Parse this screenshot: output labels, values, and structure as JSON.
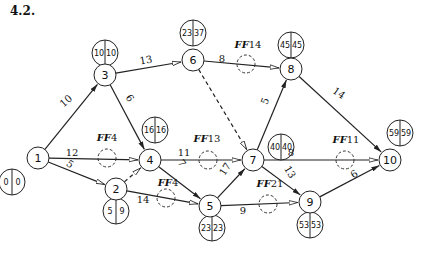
{
  "title": "4.2.",
  "nodes": [
    {
      "id": "1",
      "x": 38,
      "y": 158,
      "es": "0",
      "ls": "0",
      "tx": 12,
      "ty": 182
    },
    {
      "id": "2",
      "x": 116,
      "y": 189,
      "es": "5",
      "ls": "9",
      "tx": 116,
      "ty": 211
    },
    {
      "id": "3",
      "x": 105,
      "y": 75,
      "es": "10",
      "ls": "10",
      "tx": 105,
      "ty": 53
    },
    {
      "id": "4",
      "x": 150,
      "y": 160,
      "es": "16",
      "ls": "16",
      "tx": 155,
      "ty": 130
    },
    {
      "id": "5",
      "x": 210,
      "y": 206,
      "es": "23",
      "ls": "23",
      "tx": 212,
      "ty": 228
    },
    {
      "id": "6",
      "x": 193,
      "y": 60,
      "es": "23",
      "ls": "37",
      "tx": 193,
      "ty": 33
    },
    {
      "id": "7",
      "x": 253,
      "y": 160,
      "es": "40",
      "ls": "40",
      "tx": 281,
      "ty": 147
    },
    {
      "id": "8",
      "x": 291,
      "y": 69,
      "es": "45",
      "ls": "45",
      "tx": 291,
      "ty": 45
    },
    {
      "id": "9",
      "x": 310,
      "y": 202,
      "es": "53",
      "ls": "53",
      "tx": 310,
      "ty": 225
    },
    {
      "id": "10",
      "x": 390,
      "y": 160,
      "es": "59",
      "ls": "59",
      "tx": 400,
      "ty": 133
    }
  ],
  "edges": [
    {
      "from": "1",
      "to": "3",
      "duration": "10",
      "critical": true,
      "dashed": false,
      "lx": 66,
      "ly": 101,
      "rot": -42
    },
    {
      "from": "1",
      "to": "4",
      "duration": "12",
      "critical": false,
      "dashed": false,
      "lx": 72,
      "ly": 152,
      "rot": 0,
      "ff": {
        "label": "FF",
        "value": "4",
        "cx": 107,
        "cy": 158,
        "tx": 107,
        "ty": 141
      }
    },
    {
      "from": "1",
      "to": "2",
      "duration": "5",
      "critical": false,
      "dashed": false,
      "lx": 70,
      "ly": 164,
      "rot": 35
    },
    {
      "from": "3",
      "to": "6",
      "duration": "13",
      "critical": false,
      "dashed": false,
      "lx": 146,
      "ly": 60,
      "rot": -10
    },
    {
      "from": "3",
      "to": "4",
      "duration": "6",
      "critical": true,
      "dashed": false,
      "lx": 130,
      "ly": 98,
      "rot": 55
    },
    {
      "from": "2",
      "to": "4",
      "duration": "",
      "critical": false,
      "dashed": true
    },
    {
      "from": "4",
      "to": "7",
      "duration": "11",
      "critical": false,
      "dashed": false,
      "lx": 184,
      "ly": 152,
      "rot": 0,
      "ff": {
        "label": "FF",
        "value": "13",
        "cx": 208,
        "cy": 160,
        "tx": 207,
        "ty": 142
      }
    },
    {
      "from": "4",
      "to": "5",
      "duration": "7",
      "critical": true,
      "dashed": false,
      "lx": 182,
      "ly": 163,
      "rot": 55
    },
    {
      "from": "2",
      "to": "5",
      "duration": "14",
      "critical": false,
      "dashed": false,
      "lx": 143,
      "ly": 199,
      "rot": 0,
      "ff": {
        "label": "FF",
        "value": "4",
        "cx": 166,
        "cy": 198,
        "tx": 168,
        "ty": 186
      }
    },
    {
      "from": "5",
      "to": "7",
      "duration": "17",
      "critical": true,
      "dashed": false,
      "lx": 225,
      "ly": 169,
      "rot": -57
    },
    {
      "from": "6",
      "to": "8",
      "duration": "8",
      "critical": false,
      "dashed": false,
      "lx": 222,
      "ly": 58,
      "rot": 0,
      "ff": {
        "label": "FF",
        "value": "14",
        "cx": 246,
        "cy": 64,
        "tx": 248,
        "ty": 48
      }
    },
    {
      "from": "6",
      "to": "7",
      "duration": "",
      "critical": false,
      "dashed": true
    },
    {
      "from": "7",
      "to": "8",
      "duration": "5",
      "critical": true,
      "dashed": false,
      "lx": 265,
      "ly": 101,
      "rot": -68
    },
    {
      "from": "5",
      "to": "9",
      "duration": "9",
      "critical": false,
      "dashed": false,
      "lx": 243,
      "ly": 210,
      "rot": 0,
      "ff": {
        "label": "FF",
        "value": "21",
        "cx": 268,
        "cy": 204,
        "tx": 270,
        "ty": 187
      }
    },
    {
      "from": "7",
      "to": "10",
      "duration": "8",
      "critical": false,
      "dashed": false,
      "lx": 291,
      "ly": 152,
      "rot": 0,
      "ff": {
        "label": "FF",
        "value": "11",
        "cx": 345,
        "cy": 160,
        "tx": 346,
        "ty": 143
      }
    },
    {
      "from": "7",
      "to": "9",
      "duration": "13",
      "critical": true,
      "dashed": false,
      "lx": 290,
      "ly": 172,
      "rot": 58
    },
    {
      "from": "8",
      "to": "10",
      "duration": "14",
      "critical": true,
      "dashed": false,
      "lx": 339,
      "ly": 93,
      "rot": 35
    },
    {
      "from": "9",
      "to": "10",
      "duration": "6",
      "critical": true,
      "dashed": false,
      "lx": 354,
      "ly": 174,
      "rot": -35
    }
  ]
}
